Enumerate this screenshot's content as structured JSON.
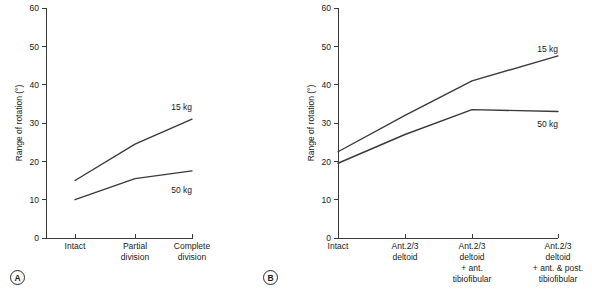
{
  "figure": {
    "background": "#ffffff",
    "line_color": "#3a3a3a",
    "text_color": "#1a1a1a"
  },
  "panels": [
    {
      "tag": "A",
      "ylabel": "Range of rotation (°)",
      "yticks": [
        "0",
        "10",
        "20",
        "30",
        "40",
        "50",
        "60"
      ],
      "xticks": [
        {
          "line1": "Intact",
          "line2": "",
          "line3": "",
          "line4": ""
        },
        {
          "line1": "Partial",
          "line2": "division",
          "line3": "",
          "line4": ""
        },
        {
          "line1": "Complete",
          "line2": "division",
          "line3": "",
          "line4": ""
        }
      ],
      "series": [
        {
          "name": "15 kg",
          "label": "15 kg"
        },
        {
          "name": "50 kg",
          "label": "50 kg"
        }
      ]
    },
    {
      "tag": "B",
      "ylabel": "Range of rotation (°)",
      "yticks": [
        "0",
        "10",
        "20",
        "30",
        "40",
        "50",
        "60"
      ],
      "xticks": [
        {
          "line1": "Intact",
          "line2": "",
          "line3": "",
          "line4": ""
        },
        {
          "line1": "Ant.2/3",
          "line2": "deltoid",
          "line3": "",
          "line4": ""
        },
        {
          "line1": "Ant.2/3",
          "line2": "deltoid",
          "line3": "+ ant.",
          "line4": "tibiofibular"
        },
        {
          "line1": "Ant.2/3",
          "line2": "deltoid",
          "line3": "+ ant. & post.",
          "line4": "tibiofibular"
        }
      ],
      "series": [
        {
          "name": "15 kg",
          "label": "15 kg"
        },
        {
          "name": "50 kg",
          "label": "50 kg"
        }
      ]
    }
  ],
  "chart_data": [
    {
      "type": "line",
      "title": "",
      "xlabel": "",
      "ylabel": "Range of rotation (°)",
      "categories": [
        "Intact",
        "Partial division",
        "Complete division"
      ],
      "ylim": [
        0,
        60
      ],
      "yticks": [
        0,
        10,
        20,
        30,
        40,
        50,
        60
      ],
      "grid": false,
      "legend": "inline-right-of-line",
      "series": [
        {
          "name": "15 kg",
          "values": [
            15,
            24.5,
            31
          ]
        },
        {
          "name": "50 kg",
          "values": [
            10,
            15.5,
            17.5
          ]
        }
      ],
      "annotations": [
        "15 kg",
        "50 kg",
        "A"
      ]
    },
    {
      "type": "line",
      "title": "",
      "xlabel": "",
      "ylabel": "Range of rotation (°)",
      "categories": [
        "Intact",
        "Ant.2/3 deltoid",
        "Ant.2/3 deltoid + ant. tibiofibular",
        "Ant.2/3 deltoid + ant. & post. tibiofibular"
      ],
      "ylim": [
        0,
        60
      ],
      "yticks": [
        0,
        10,
        20,
        30,
        40,
        50,
        60
      ],
      "grid": false,
      "legend": "inline-right-of-line",
      "series": [
        {
          "name": "15 kg",
          "values": [
            22.5,
            32,
            41,
            47.5
          ]
        },
        {
          "name": "50 kg",
          "values": [
            19.5,
            27,
            33.5,
            33
          ]
        }
      ],
      "annotations": [
        "15 kg",
        "50 kg",
        "B"
      ]
    }
  ]
}
